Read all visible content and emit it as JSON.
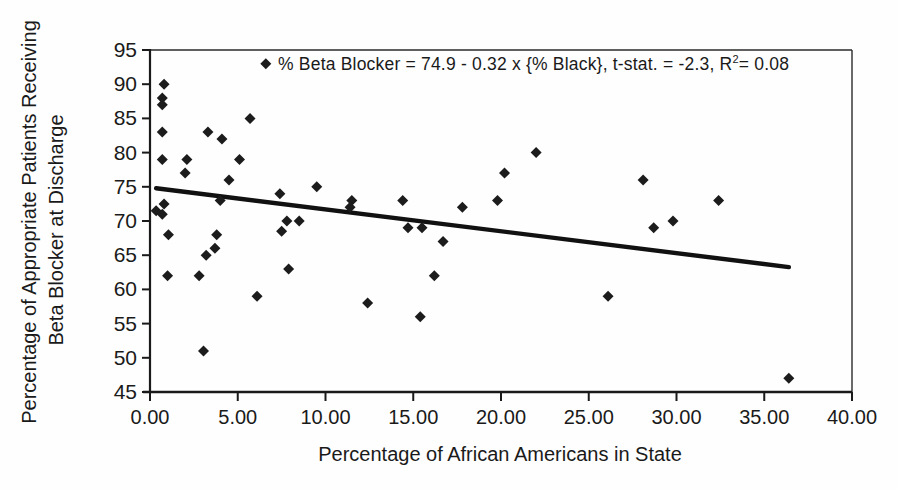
{
  "chart_data": {
    "type": "scatter",
    "title": "",
    "xlabel": "Percentage of African Americans in State",
    "ylabel_line1": "Percentage of Appropriate Patients Receiving",
    "ylabel_line2": "Beta Blocker at Discharge",
    "annotation": {
      "text_before_sup": "% Beta Blocker = 74.9 - 0.32 x {% Black},  t-stat. = -2.3, R",
      "sup": "2",
      "text_after_sup": "= 0.08"
    },
    "xlim": [
      0,
      40
    ],
    "ylim": [
      45,
      95
    ],
    "x_tick_values": [
      0,
      5,
      10,
      15,
      20,
      25,
      30,
      35,
      40
    ],
    "x_tick_labels": [
      "0.00",
      "5.00",
      "10.00",
      "15.00",
      "20.00",
      "25.00",
      "30.00",
      "35.00",
      "40.00"
    ],
    "y_tick_values": [
      45,
      50,
      55,
      60,
      65,
      70,
      75,
      80,
      85,
      90,
      95
    ],
    "y_tick_labels": [
      "45",
      "50",
      "55",
      "60",
      "65",
      "70",
      "75",
      "80",
      "85",
      "90",
      "95"
    ],
    "grid": false,
    "legend": "none",
    "marker": "diamond",
    "colors": {
      "marker": "#1c1c1c",
      "trendline": "#111111",
      "axis": "#1a1a1a",
      "text": "#1a1a1a",
      "background": "#ffffff"
    },
    "points": [
      [
        0.8,
        90
      ],
      [
        0.7,
        88
      ],
      [
        0.7,
        87
      ],
      [
        0.7,
        83
      ],
      [
        0.7,
        79
      ],
      [
        2.1,
        79
      ],
      [
        2.0,
        77
      ],
      [
        3.3,
        83
      ],
      [
        4.1,
        82
      ],
      [
        5.1,
        79
      ],
      [
        5.7,
        85
      ],
      [
        6.6,
        93
      ],
      [
        4.5,
        76
      ],
      [
        9.5,
        75
      ],
      [
        7.4,
        74
      ],
      [
        4.0,
        73
      ],
      [
        0.8,
        72.5
      ],
      [
        0.35,
        71.5
      ],
      [
        0.7,
        71
      ],
      [
        1.05,
        68
      ],
      [
        3.8,
        68
      ],
      [
        3.7,
        66
      ],
      [
        3.2,
        65
      ],
      [
        1.0,
        62
      ],
      [
        2.8,
        62
      ],
      [
        3.05,
        51
      ],
      [
        6.1,
        59
      ],
      [
        7.8,
        70
      ],
      [
        8.5,
        70
      ],
      [
        7.5,
        68.5
      ],
      [
        7.9,
        63
      ],
      [
        12.4,
        58
      ],
      [
        11.5,
        73
      ],
      [
        11.4,
        72
      ],
      [
        14.4,
        73
      ],
      [
        14.7,
        69
      ],
      [
        15.5,
        69
      ],
      [
        16.7,
        67
      ],
      [
        16.2,
        62
      ],
      [
        15.4,
        56
      ],
      [
        17.8,
        72
      ],
      [
        19.8,
        73
      ],
      [
        20.2,
        77
      ],
      [
        22.0,
        80
      ],
      [
        26.1,
        59
      ],
      [
        28.1,
        76
      ],
      [
        28.7,
        69
      ],
      [
        29.8,
        70
      ],
      [
        32.4,
        73
      ],
      [
        36.4,
        47
      ]
    ],
    "trendline": {
      "equation": "% Beta Blocker = 74.9 - 0.32 x {% Black}",
      "intercept": 74.9,
      "slope": -0.32,
      "x_start": 0.35,
      "x_end": 36.4
    }
  }
}
